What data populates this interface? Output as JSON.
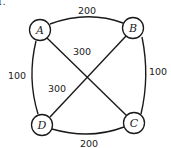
{
  "problem_number": "1.",
  "graph": {
    "nodes": [
      {
        "id": "A",
        "label": "A"
      },
      {
        "id": "B",
        "label": "B"
      },
      {
        "id": "C",
        "label": "C"
      },
      {
        "id": "D",
        "label": "D"
      }
    ],
    "edges": [
      {
        "from": "A",
        "to": "B",
        "weight": "200",
        "style": "curved"
      },
      {
        "from": "B",
        "to": "C",
        "weight": "100",
        "style": "curved"
      },
      {
        "from": "D",
        "to": "C",
        "weight": "200",
        "style": "curved"
      },
      {
        "from": "A",
        "to": "D",
        "weight": "100",
        "style": "curved"
      },
      {
        "from": "A",
        "to": "C",
        "weight": "300",
        "style": "straight"
      },
      {
        "from": "B",
        "to": "D",
        "weight": "300",
        "style": "straight"
      }
    ]
  },
  "colors": {
    "stroke": "#1a1a1a",
    "background": "#ffffff"
  }
}
